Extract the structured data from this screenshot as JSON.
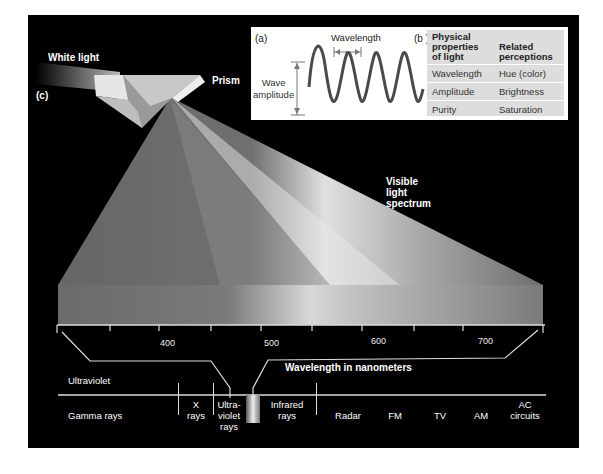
{
  "figure": {
    "panel_labels": {
      "a": "(a)",
      "b": "(b )",
      "c": "(c)"
    },
    "labels": {
      "white_light": "White light",
      "prism": "Prism",
      "visible_spectrum_line1": "Visible",
      "visible_spectrum_line2": "light",
      "visible_spectrum_line3": "spectrum",
      "ultraviolet": "Ultraviolet",
      "axis_title": "Wavelength in nanometers"
    },
    "wave_diagram": {
      "wavelength_label": "Wavelength",
      "amplitude_label_line1": "Wave",
      "amplitude_label_line2": "amplitude"
    },
    "properties_table": {
      "headers": [
        "Physical properties of light",
        "Related perceptions"
      ],
      "header_lines": {
        "col1": [
          "Physical",
          "properties",
          "of light"
        ],
        "col2": [
          "Related",
          "perceptions"
        ]
      },
      "rows": [
        {
          "physical": "Wavelength",
          "perception": "Hue (color)"
        },
        {
          "physical": "Amplitude",
          "perception": "Brightness"
        },
        {
          "physical": "Purity",
          "perception": "Saturation"
        }
      ]
    },
    "axis": {
      "ticks": [
        "400",
        "500",
        "600",
        "700"
      ],
      "range_nm": [
        350,
        750
      ]
    },
    "em_spectrum_bands": [
      {
        "label": "Gamma rays"
      },
      {
        "label_line1": "X",
        "label_line2": "rays"
      },
      {
        "label_line1": "Ultra-",
        "label_line2": "violet",
        "label_line3": "rays"
      },
      {
        "label_line1": "Infrared",
        "label_line2": "rays"
      },
      {
        "label": "Radar"
      },
      {
        "label": "FM"
      },
      {
        "label": "TV"
      },
      {
        "label": "AM"
      },
      {
        "label_line1": "AC",
        "label_line2": "circuits"
      }
    ],
    "colors": {
      "background": "#000000",
      "page": "#ffffff",
      "inset_bg": "#ffffff",
      "table_bg": "#dddddd",
      "text": "#ffffff"
    }
  }
}
